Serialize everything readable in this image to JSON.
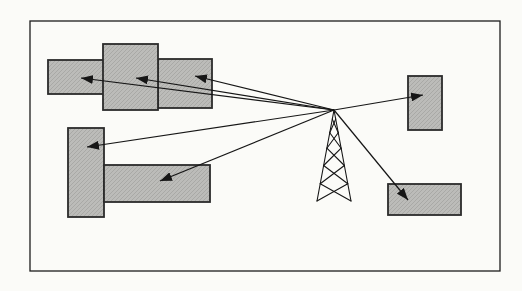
{
  "figure": {
    "canvas": {
      "width": 522,
      "height": 291
    },
    "frame": {
      "x": 30,
      "y": 21,
      "width": 470,
      "height": 250
    },
    "colors": {
      "paper": "#fbfbf8",
      "frame_stroke": "#1c1c1c",
      "building_fill": "#bcbcb9",
      "building_hatch": "rgba(0,0,0,0.10)",
      "building_stroke": "#2b2b2b",
      "line": "#161616"
    },
    "stroke_widths": {
      "frame": 1.3,
      "building": 1.8,
      "arrow": 1.2,
      "tower": 1.1
    },
    "buildings": [
      {
        "id": "top-left-left",
        "x": 48,
        "y": 60,
        "width": 56,
        "height": 34
      },
      {
        "id": "top-left-right",
        "x": 158,
        "y": 59,
        "width": 54,
        "height": 49
      },
      {
        "id": "top-left-middle",
        "x": 103,
        "y": 44,
        "width": 55,
        "height": 66
      },
      {
        "id": "mid-left-vertical",
        "x": 68,
        "y": 128,
        "width": 36,
        "height": 89
      },
      {
        "id": "mid-left-horizontal",
        "x": 104,
        "y": 165,
        "width": 106,
        "height": 37
      },
      {
        "id": "right-small",
        "x": 408,
        "y": 76,
        "width": 34,
        "height": 54
      },
      {
        "id": "bottom-right",
        "x": 388,
        "y": 184,
        "width": 73,
        "height": 31
      }
    ],
    "tower": {
      "apex": [
        334,
        110
      ],
      "base_y": 201,
      "base_half_width": 17,
      "level_fractions": [
        0.1,
        0.25,
        0.42,
        0.61,
        0.81,
        1.0
      ]
    },
    "arrows": [
      {
        "id": "signal-to-top-left-left",
        "from": [
          334,
          110
        ],
        "to": [
          81,
          78
        ]
      },
      {
        "id": "signal-to-top-left-middle",
        "from": [
          334,
          110
        ],
        "to": [
          136,
          78
        ]
      },
      {
        "id": "signal-to-top-left-right",
        "from": [
          334,
          110
        ],
        "to": [
          195,
          76
        ]
      },
      {
        "id": "signal-to-mid-left-vertical",
        "from": [
          334,
          110
        ],
        "to": [
          87,
          147
        ]
      },
      {
        "id": "signal-to-mid-left-horizontal",
        "from": [
          334,
          110
        ],
        "to": [
          160,
          181
        ]
      },
      {
        "id": "signal-to-right-small",
        "from": [
          334,
          110
        ],
        "to": [
          423,
          95
        ]
      },
      {
        "id": "signal-to-bottom-right",
        "from": [
          334,
          110
        ],
        "to": [
          408,
          200
        ]
      }
    ],
    "arrowhead": {
      "length": 12,
      "half_width": 4.5
    }
  }
}
